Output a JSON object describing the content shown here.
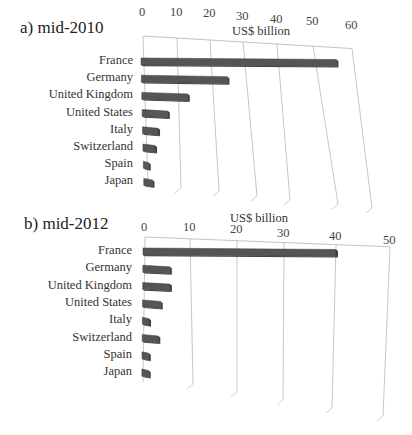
{
  "chart_data": [
    {
      "type": "bar",
      "orientation": "horizontal",
      "title": "a) mid-2010",
      "xlabel": "US$ billion",
      "ylabel": "",
      "categories": [
        "France",
        "Germany",
        "United Kingdom",
        "United States",
        "Italy",
        "Switzerland",
        "Spain",
        "Japan"
      ],
      "values": [
        56,
        25,
        13,
        7,
        4,
        3,
        1,
        2
      ],
      "xlim": [
        0,
        60
      ],
      "ticks": [
        "0",
        "10",
        "20",
        "30",
        "40",
        "50",
        "60"
      ],
      "grid": true,
      "legend": null,
      "bar_color": "#555555"
    },
    {
      "type": "bar",
      "orientation": "horizontal",
      "title": "b) mid-2012",
      "xlabel": "US$ billion",
      "ylabel": "",
      "categories": [
        "France",
        "Germany",
        "United Kingdom",
        "United States",
        "Italy",
        "Switzerland",
        "Spain",
        "Japan"
      ],
      "values": [
        40,
        5.5,
        5.5,
        3.5,
        1,
        3,
        1,
        1
      ],
      "xlim": [
        0,
        50
      ],
      "ticks": [
        "0",
        "10",
        "20",
        "30",
        "40",
        "50"
      ],
      "grid": true,
      "legend": null,
      "bar_color": "#555555"
    }
  ],
  "panels": [
    {
      "title": "a) mid-2010",
      "axis_title": "US$ billion"
    },
    {
      "title": "b) mid-2012",
      "axis_title": "US$ billion"
    }
  ]
}
